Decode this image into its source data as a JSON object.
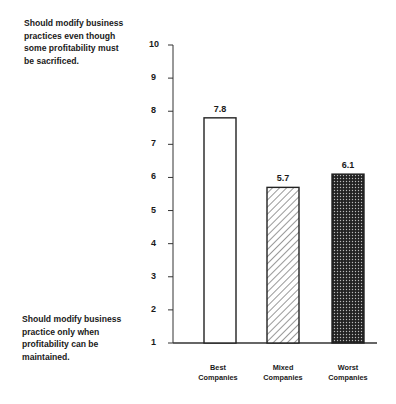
{
  "chart_data": {
    "type": "bar",
    "title": "",
    "xlabel": "",
    "ylabel": "",
    "ylim": [
      1,
      10
    ],
    "yticks": [
      1,
      2,
      3,
      4,
      5,
      6,
      7,
      8,
      9,
      10
    ],
    "grid": false,
    "categories": [
      "Best Companies",
      "Mixed Companies",
      "Worst Companies"
    ],
    "category_lines": [
      [
        "Best",
        "Companies"
      ],
      [
        "Mixed",
        "Companies"
      ],
      [
        "Worst",
        "Companies"
      ]
    ],
    "values": [
      7.8,
      5.7,
      6.1
    ],
    "value_labels": [
      "7.8",
      "5.7",
      "6.1"
    ],
    "fills": [
      "white",
      "diagonal-hatch",
      "dark-dotted"
    ],
    "annotations": {
      "top": [
        "Should modify business",
        "practices even though",
        "some profitability must",
        "be sacrificed."
      ],
      "bottom": [
        "Should modify business",
        "practice only when",
        "profitability can be",
        "maintained."
      ]
    }
  }
}
